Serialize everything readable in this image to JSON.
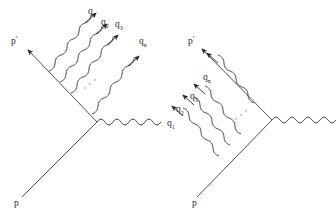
{
  "figure": {
    "background_color": "#ffffff",
    "line_color": "#3a3a3a",
    "label_color": "#2b2b2b"
  },
  "diagrams": [
    {
      "id": "left",
      "name": "emission-from-outgoing-leg",
      "caption": "n soft photons radiated off the outgoing fermion line",
      "incoming": {
        "label": "p",
        "prime": ""
      },
      "outgoing": {
        "label": "p",
        "prime": "′"
      },
      "external_photon": {
        "label": "",
        "direction": "right"
      },
      "photons": [
        {
          "label": "q",
          "sub": "1"
        },
        {
          "label": "q",
          "sub": "2"
        },
        {
          "label": "q",
          "sub": "3"
        },
        {
          "label": "q",
          "sub": "n"
        }
      ],
      "ellipsis": "⋯"
    },
    {
      "id": "right",
      "name": "emission-from-incoming-leg",
      "caption": "n soft photons radiated off the incoming fermion line",
      "incoming": {
        "label": "p",
        "prime": ""
      },
      "outgoing": {
        "label": "p",
        "prime": "′"
      },
      "external_photon": {
        "label": "",
        "direction": "right"
      },
      "photons": [
        {
          "label": "q",
          "sub": "n"
        },
        {
          "label": "q",
          "sub": "3"
        },
        {
          "label": "q",
          "sub": "2"
        },
        {
          "label": "q",
          "sub": "1"
        }
      ],
      "ellipsis": "⋯"
    }
  ]
}
